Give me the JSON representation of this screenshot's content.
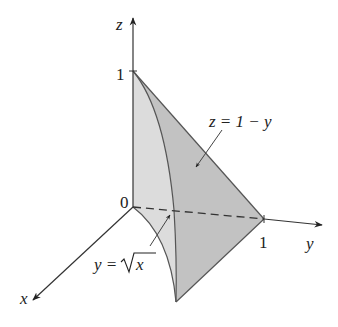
{
  "diagram": {
    "type": "3d-region",
    "axes": {
      "x_label": "x",
      "y_label": "y",
      "z_label": "z"
    },
    "ticks": {
      "origin": "0",
      "z_one": "1",
      "y_one": "1"
    },
    "annotations": {
      "plane": "z = 1 − y",
      "curve_lhs": "y =",
      "curve_rad": "x"
    },
    "colors": {
      "axis": "#333333",
      "face_light": "#dcdcdc",
      "face_dark": "#c2c2c2",
      "edge": "#555555"
    }
  }
}
